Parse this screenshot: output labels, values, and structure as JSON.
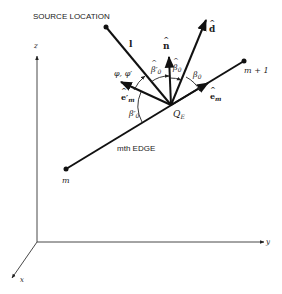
{
  "diagram": {
    "title": "SOURCE LOCATION",
    "edge_label": "mth EDGE",
    "points": {
      "m": "m",
      "m_plus_1": "m + 1",
      "Q_E": "Q",
      "Q_E_sub": "E"
    },
    "vectors": {
      "l": "l",
      "n_hat": "n",
      "d_hat": "d",
      "e_m": "e",
      "e_m_sub": "m",
      "e_m_prime": "e",
      "e_m_prime_sub": "m",
      "e_m_prime_mark": "′"
    },
    "angles": {
      "phi": "φ, φ′",
      "beta0": "β",
      "beta0_sub": "0",
      "beta0_hat": "β",
      "beta0_hat_sub": "0",
      "beta0_prime_hat": "β′",
      "beta0_prime_hat_sub": "0",
      "beta0_prime": "β′",
      "beta0_prime_sub": "0"
    },
    "axes": {
      "x": "x",
      "y": "y",
      "z": "z"
    }
  }
}
